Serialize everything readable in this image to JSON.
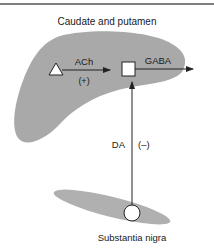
{
  "diagram": {
    "title": "Caudate and putamen",
    "regions": {
      "striatum": {
        "label": "Caudate and putamen",
        "color": "#a9a9a9"
      },
      "substantia_nigra": {
        "label": "Substantia nigra",
        "color": "#b0b0b0"
      }
    },
    "nodes": {
      "cholinergic_neuron": {
        "shape": "triangle"
      },
      "gabaergic_neuron": {
        "shape": "square"
      },
      "dopaminergic_neuron": {
        "shape": "circle"
      }
    },
    "connections": {
      "ach": {
        "label": "ACh",
        "effect": "(+)"
      },
      "gaba": {
        "label": "GABA"
      },
      "da": {
        "label": "DA",
        "effect": "(–)"
      }
    },
    "colors": {
      "rule": "#555555",
      "line": "#222222",
      "node_fill": "#ffffff"
    }
  }
}
